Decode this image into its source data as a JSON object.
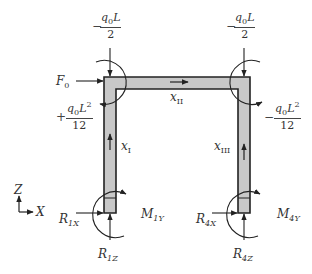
{
  "diagram": {
    "type": "frame-structure-free-body-diagram",
    "colors": {
      "member_fill": "#c8c8c8",
      "member_stroke": "#222222",
      "arrow": "#222222",
      "text": "#333333",
      "background": "#ffffff"
    },
    "loads": {
      "top_left_force": {
        "sign": "−",
        "numerator": "q",
        "numerator_sub": "0",
        "numerator_tail": "L",
        "denominator": "2"
      },
      "top_right_force": {
        "sign": "−",
        "numerator": "q",
        "numerator_sub": "0",
        "numerator_tail": "L",
        "denominator": "2"
      },
      "left_moment": {
        "sign": "+",
        "numerator": "q",
        "numerator_sub": "0",
        "numerator_tail": "L",
        "numerator_sup": "2",
        "denominator": "12"
      },
      "right_moment": {
        "sign": "−",
        "numerator": "q",
        "numerator_sub": "0",
        "numerator_tail": "L",
        "numerator_sup": "2",
        "denominator": "12"
      },
      "horizontal_force": {
        "symbol": "F",
        "sub": "0"
      }
    },
    "coordinates": {
      "x1": {
        "symbol": "x",
        "sub": "I"
      },
      "x2": {
        "symbol": "x",
        "sub": "II"
      },
      "x3": {
        "symbol": "x",
        "sub": "III"
      }
    },
    "reactions": {
      "R1X": {
        "symbol": "R",
        "sub": "1X"
      },
      "R1Z": {
        "symbol": "R",
        "sub": "1Z"
      },
      "M1Y": {
        "symbol": "M",
        "sub": "1Y"
      },
      "R4X": {
        "symbol": "R",
        "sub": "4X"
      },
      "R4Z": {
        "symbol": "R",
        "sub": "4Z"
      },
      "M4Y": {
        "symbol": "M",
        "sub": "4Y"
      }
    },
    "axes": {
      "vertical": "Z",
      "horizontal": "X"
    }
  }
}
